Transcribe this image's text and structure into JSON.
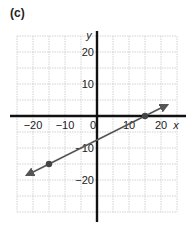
{
  "panel_label": "(c)",
  "chart_data": {
    "type": "line",
    "title": "",
    "xlabel": "x",
    "ylabel": "y",
    "xlim": [
      -25,
      25
    ],
    "ylim": [
      -30,
      25
    ],
    "grid": true,
    "grid_step": 5,
    "x_ticks": [
      {
        "value": -20,
        "label": "−20"
      },
      {
        "value": -10,
        "label": "−10"
      },
      {
        "value": 0,
        "label": "0"
      },
      {
        "value": 10,
        "label": "10"
      },
      {
        "value": 20,
        "label": "20"
      }
    ],
    "y_ticks": [
      {
        "value": 20,
        "label": "20"
      },
      {
        "value": 10,
        "label": "10"
      },
      {
        "value": -10,
        "label": "−10"
      },
      {
        "value": -20,
        "label": "−20"
      }
    ],
    "series": [
      {
        "name": "line",
        "equation": "y = 0.5x - 7.5",
        "start": [
          -22,
          -18.5
        ],
        "end": [
          22,
          3.5
        ],
        "arrows": "both",
        "points": [
          [
            -15,
            -15
          ],
          [
            15,
            0
          ]
        ],
        "color": "#555555"
      }
    ],
    "legend": null
  }
}
